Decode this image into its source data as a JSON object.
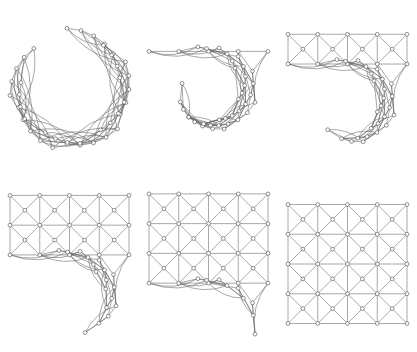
{
  "figure": {
    "background_color": "#ffffff",
    "edge_color": "#606060",
    "node_fill_color": "#ffffff",
    "node_stroke_color": "#4a4a4a",
    "columns": 3,
    "rows": 2
  },
  "chart_data": {
    "type": "diagram",
    "xlabel": "",
    "ylabel": "",
    "graph": {
      "name": "triangulated-square-mesh",
      "grid_columns": 5,
      "grid_rows": 5,
      "corner_node_count": 25,
      "center_node_count": 16,
      "total_node_count": 41,
      "cell_columns": 4,
      "cell_rows": 4,
      "edge_pattern": "horizontal + vertical grid edges plus both cell diagonals through cell-center nodes"
    },
    "panels": [
      {
        "index": 1,
        "label": "panel-1",
        "state": "fully-curled",
        "rows_unrolled": 0,
        "description": "Mesh curled into a closed annular spiral; nodes form a ring with dense chords crossing the interior"
      },
      {
        "index": 2,
        "label": "panel-2",
        "state": "one-row-unrolled",
        "rows_unrolled": 1,
        "description": "Top row of five nodes pulled flat along the top edge while the remainder stays curled"
      },
      {
        "index": 3,
        "label": "panel-3",
        "state": "two-rows-unrolled",
        "rows_unrolled": 2,
        "description": "First band of triangulated cells flattened into a horizontal strip; long edges trail into the curled tail"
      },
      {
        "index": 4,
        "label": "panel-4",
        "state": "three-rows-unrolled",
        "rows_unrolled": 3,
        "description": "Two bands of cells flat; remaining nodes gathered in a curled fan below"
      },
      {
        "index": 5,
        "label": "panel-5",
        "state": "four-rows-unrolled",
        "rows_unrolled": 4,
        "description": "Nearly complete grid with only the final corner nodes still curling outward"
      },
      {
        "index": 6,
        "label": "panel-6",
        "state": "fully-unrolled",
        "rows_unrolled": 5,
        "description": "Complete flat 5x5 triangulated grid with cell-center nodes and both diagonals per cell"
      }
    ]
  }
}
